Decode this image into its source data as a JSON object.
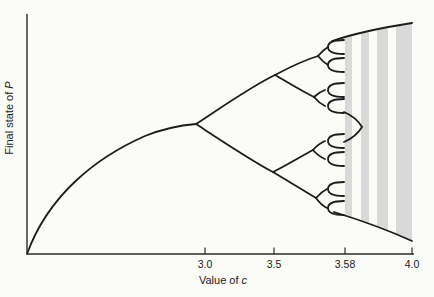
{
  "figure": {
    "xlabel": {
      "prefix": "Value of ",
      "variable": "c"
    },
    "ylabel": {
      "prefix": "Final state of ",
      "variable": "P"
    },
    "x_ticks": [
      {
        "label": "3.0"
      },
      {
        "label": "3.5"
      },
      {
        "label": "3.58"
      },
      {
        "label": "4.0"
      }
    ]
  },
  "colors": {
    "background": "#fbfbf8",
    "line": "#1c1c1c",
    "band_gray": "#d9d9d9",
    "window_white": "#fbfbf8"
  },
  "chart_data": {
    "type": "line",
    "subtype": "bifurcation_diagram",
    "title": "",
    "xlabel": "Value of c",
    "ylabel": "Final state of P",
    "x_tick_labels": [
      "3.0",
      "3.5",
      "3.58",
      "4.0"
    ],
    "x_tick_values": [
      3.0,
      3.5,
      3.58,
      4.0
    ],
    "axis_note": "schematic textbook figure; x spacing nonlinear, y axis has no numeric ticks",
    "chaos_onset_c": 3.58,
    "chaotic_region_c": [
      3.58,
      4.0
    ],
    "periodic_windows_c_approx": [
      [
        3.62,
        3.68
      ],
      [
        3.73,
        3.78
      ],
      [
        3.85,
        3.9
      ]
    ],
    "branches": {
      "stable_equilibrium": "single curve of stable P rising from the origin up to the first bifurcation at c = 3.0",
      "period_2": "two branches between c = 3.0 and the second bifurcation (~c = 3.45)",
      "period_4_8": "period-doubling cascade of forks and small crescent branch tips between ~3.45 and 3.58",
      "chaos": "gray shaded chaotic bands from c = 3.58 to 4.0 interrupted by white periodic windows, bounded by upper and lower envelope curves, with a white wedge where the two chaotic bands merge"
    }
  },
  "geometry": {
    "y_axis": "M27,14 L27,254",
    "x_axis": "M27,254 L414,254",
    "ticks": [
      "M205,247.5 L205,254",
      "M274,247.5 L274,254",
      "M345,247.5 L345,254",
      "M412,247.5 L412,254"
    ],
    "band": "M345,36 C369,30 393,26 412,23 L412,241 C393,232 369,224 345,215 Z",
    "stripes": [
      "M352,18 h9 v230 h-9 Z",
      "M369,18 h8 v230 h-8 Z",
      "M388,18 h8 v230 h-8 Z"
    ],
    "tongue": "M344,112 Q356,117 362,127 Q356,137 344,142",
    "main_curve": "M27,254 C48,196 95,158 145,136 C165,128 184,125 196,124",
    "branch_up": "M196,124 C222,107 252,86 275,75",
    "branch_down": "M196,124 C222,141 252,161 273,172",
    "fork_u_up": "M275,75 C290,67 305,60 318,56",
    "fork_u_down": "M275,75 C289,83 302,91 314,97",
    "fork_l_up": "M273,172 C287,165 300,157 313,150",
    "fork_l_down": "M273,172 C288,181 303,190 316,198",
    "connectors": [
      "M318,56 Q323,50 328,47",
      "M318,56 Q323,62 328,65",
      "M314,97 Q319,92 325,90",
      "M314,97 Q319,103 325,106",
      "M313,150 Q318,144 325,141",
      "M313,150 Q318,156 325,159",
      "M316,198 Q321,192 327,189",
      "M316,198 Q321,205 327,208"
    ],
    "beaks": [
      "M344,40 C333,40 328,43 328,47 C328,51 333,54 344,54",
      "M344,58 C333,58 328,61 328,65 C328,69 333,72 344,72",
      "M344,83 C333,83 328,86 328,90 C328,94 333,97 344,97",
      "M344,99 C333,99 328,102 328,106 C328,110 333,113 344,113",
      "M344,134 C333,134 328,137 328,141 C328,145 333,148 344,148",
      "M344,152 C333,152 328,155 328,159 C328,163 333,166 344,166",
      "M344,182 C333,182 328,185 328,189 C328,193 333,196 344,196",
      "M344,201 C333,201 328,204 328,208 C328,212 333,215 344,215"
    ],
    "top_envelope": "M332,41 C356,33 386,27 412,23",
    "bottom_envelope": "M334,212 C360,220 390,231 412,241"
  }
}
